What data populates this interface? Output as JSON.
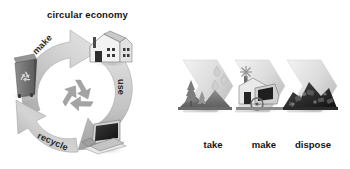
{
  "figure": {
    "background_color": "#ffffff",
    "palette": {
      "ink": "#141414",
      "arrow_light": "#d9d9d9",
      "arrow_mid": "#b5b5b5",
      "arrow_dark": "#8f8f8f",
      "bin_body": "#6e6e6e",
      "bin_lid": "#8a8a8a",
      "waste_dark": "#2b2b2b",
      "tree_mid": "#9a9a9a",
      "tree_dark": "#6a6a6a",
      "factory_light": "#efefef",
      "factory_shadow": "#9d9d9d",
      "screen_dark": "#1e1e1e"
    }
  },
  "circular": {
    "title": "circular economy",
    "center_icon": "recycle-symbol-icon",
    "arcs": [
      {
        "id": "make",
        "label": "make",
        "from": "waste-bin-icon",
        "to": "factory-icon"
      },
      {
        "id": "use",
        "label": "use",
        "from": "factory-icon",
        "to": "electronics-icon"
      },
      {
        "id": "recycle",
        "label": "recycle",
        "from": "electronics-icon",
        "to": "waste-bin-icon"
      }
    ],
    "nodes": [
      {
        "id": "bin",
        "icon": "recycling-bin-icon",
        "position": "left"
      },
      {
        "id": "factory",
        "icon": "factory-house-icon",
        "position": "top-right"
      },
      {
        "id": "electronics",
        "icon": "old-computer-icon",
        "position": "bottom-right"
      }
    ]
  },
  "linear": {
    "title": "linear economy",
    "steps": [
      {
        "id": "take",
        "label": "take",
        "icon": "trees-and-water-drops-icon"
      },
      {
        "id": "make",
        "label": "make",
        "icon": "factory-and-machine-icon"
      },
      {
        "id": "dispose",
        "label": "dispose",
        "icon": "landfill-waste-pile-icon"
      }
    ]
  }
}
